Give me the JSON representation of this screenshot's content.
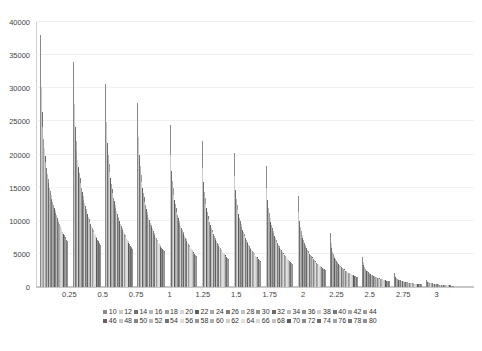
{
  "chart_data": {
    "type": "bar",
    "title": "",
    "subtitle": "",
    "xlabel": "",
    "ylabel": "",
    "xlim": [
      0,
      3.28
    ],
    "ylim": [
      0,
      40000
    ],
    "grid": true,
    "legend_position": "bottom",
    "y_ticks": [
      0,
      5000,
      10000,
      15000,
      20000,
      25000,
      30000,
      35000,
      40000
    ],
    "y_tick_labels": [
      "0",
      "5000",
      "10000",
      "15000",
      "20000",
      "25000",
      "30000",
      "35000",
      "40000"
    ],
    "x_ticks": [
      0.25,
      0.5,
      0.75,
      1,
      1.25,
      1.5,
      1.75,
      2,
      2.25,
      2.5,
      2.75,
      3
    ],
    "x_tick_labels": [
      "0.25",
      "0.5",
      "0.75",
      "1",
      "1.25",
      "1.5",
      "1.75",
      "2",
      "2.25",
      "2.5",
      "2.75",
      "3"
    ],
    "series_names": [
      "10",
      "12",
      "14",
      "16",
      "18",
      "20",
      "22",
      "24",
      "26",
      "28",
      "30",
      "32",
      "34",
      "36",
      "38",
      "40",
      "42",
      "44",
      "46",
      "48",
      "50",
      "52",
      "54",
      "56",
      "58",
      "60",
      "62",
      "64",
      "66",
      "68",
      "70",
      "72",
      "74",
      "76",
      "78",
      "80"
    ],
    "series_colors": [
      "#8a8a8a",
      "#c9c9c9",
      "#6f6f6f",
      "#b4b4b4",
      "#9e9e9e",
      "#d6d6d6",
      "#5f5f5f",
      "#a8a8a8",
      "#7d7d7d",
      "#c0c0c0",
      "#949494",
      "#6a6a6a",
      "#bdbdbd",
      "#8f8f8f",
      "#d0d0d0",
      "#777777",
      "#ababab",
      "#9a9a9a",
      "#636363",
      "#c5c5c5",
      "#858585",
      "#b8b8b8",
      "#737373",
      "#dcdcdc",
      "#989898",
      "#aeaeae",
      "#cfcfcf",
      "#e0e0e0",
      "#d9d9d9",
      "#c3c3c3",
      "#5a5a5a",
      "#8c8c8c",
      "#6c6c6c",
      "#a0a0a0",
      "#7a7a7a",
      "#909090"
    ],
    "categories": [
      0.1,
      0.2,
      0.3,
      0.4,
      0.5,
      0.6,
      0.7,
      0.8,
      0.9,
      1.0,
      1.1,
      1.2,
      1.3
    ],
    "clusters": [
      {
        "x_start": 0.03,
        "peak": 38000,
        "tail": 7200,
        "n": 36
      },
      {
        "x_start": 0.28,
        "peak": 34000,
        "tail": 7000,
        "n": 36
      },
      {
        "x_start": 0.52,
        "peak": 30600,
        "tail": 6500,
        "n": 36
      },
      {
        "x_start": 0.76,
        "peak": 27800,
        "tail": 6100,
        "n": 36
      },
      {
        "x_start": 1.0,
        "peak": 24500,
        "tail": 5500,
        "n": 36
      },
      {
        "x_start": 1.24,
        "peak": 22000,
        "tail": 4900,
        "n": 36
      },
      {
        "x_start": 1.48,
        "peak": 20300,
        "tail": 4200,
        "n": 36
      },
      {
        "x_start": 1.72,
        "peak": 18200,
        "tail": 3400,
        "n": 36
      },
      {
        "x_start": 1.96,
        "peak": 13800,
        "tail": 2600,
        "n": 36
      },
      {
        "x_start": 2.2,
        "peak": 8200,
        "tail": 1800,
        "n": 36
      },
      {
        "x_start": 2.44,
        "peak": 4600,
        "tail": 900,
        "n": 36
      },
      {
        "x_start": 2.68,
        "peak": 2100,
        "tail": 400,
        "n": 36
      },
      {
        "x_start": 2.92,
        "peak": 1100,
        "tail": 150,
        "n": 36
      }
    ],
    "series": [
      {
        "name": "10",
        "values": [
          38000,
          34000,
          30600,
          27800,
          24500,
          22000,
          20300,
          18200,
          13800,
          8200,
          4600,
          2100,
          1100
        ]
      },
      {
        "name": "12",
        "values": [
          30200,
          27600,
          24900,
          22700,
          20000,
          18000,
          16700,
          14900,
          11300,
          6700,
          3750,
          1720,
          900
        ]
      },
      {
        "name": "14",
        "values": [
          26400,
          24200,
          21800,
          19900,
          17500,
          15800,
          14600,
          13100,
          9900,
          5900,
          3300,
          1510,
          790
        ]
      },
      {
        "name": "16",
        "values": [
          24100,
          22100,
          19900,
          18200,
          16000,
          14400,
          13300,
          11900,
          9000,
          5350,
          3000,
          1370,
          715
        ]
      },
      {
        "name": "18",
        "values": [
          22400,
          20500,
          18500,
          16900,
          14900,
          13400,
          12400,
          11100,
          8400,
          4980,
          2790,
          1275,
          665
        ]
      },
      {
        "name": "20",
        "values": [
          21000,
          19200,
          17350,
          15850,
          13950,
          12550,
          11600,
          10400,
          7870,
          4670,
          2620,
          1195,
          625
        ]
      },
      {
        "name": "22",
        "values": [
          19850,
          18150,
          16400,
          14980,
          13200,
          11870,
          10970,
          9830,
          7440,
          4410,
          2470,
          1130,
          590
        ]
      },
      {
        "name": "24",
        "values": [
          18830,
          17220,
          15560,
          14210,
          12520,
          11260,
          10410,
          9320,
          7060,
          4185,
          2345,
          1072,
          560
        ]
      },
      {
        "name": "26",
        "values": [
          17920,
          16390,
          14810,
          13520,
          11910,
          10710,
          9900,
          8870,
          6715,
          3982,
          2231,
          1020,
          532
        ]
      },
      {
        "name": "28",
        "values": [
          17100,
          15640,
          14130,
          12900,
          11360,
          10220,
          9450,
          8460,
          6406,
          3799,
          2128,
          973,
          508
        ]
      },
      {
        "name": "30",
        "values": [
          16350,
          14950,
          13510,
          12335,
          10865,
          9770,
          9035,
          8090,
          6125,
          3632,
          2035,
          930,
          486
        ]
      },
      {
        "name": "32",
        "values": [
          15660,
          14320,
          12940,
          11815,
          10405,
          9356,
          8652,
          7747,
          5866,
          3478,
          1949,
          891,
          465
        ]
      },
      {
        "name": "34",
        "values": [
          15020,
          13740,
          12415,
          11335,
          9982,
          8976,
          8300,
          7432,
          5627,
          3337,
          1869,
          854,
          446
        ]
      },
      {
        "name": "36",
        "values": [
          14430,
          13200,
          11925,
          10890,
          9590,
          8623,
          7974,
          7140,
          5406,
          3206,
          1796,
          821,
          428
        ]
      },
      {
        "name": "38",
        "values": [
          13880,
          12695,
          11470,
          10473,
          9224,
          8294,
          7670,
          6867,
          5200,
          3084,
          1727,
          790,
          412
        ]
      },
      {
        "name": "40",
        "values": [
          13360,
          12220,
          11040,
          10080,
          8878,
          7982,
          7381,
          6609,
          5004,
          2968,
          1662,
          760,
          396
        ]
      },
      {
        "name": "42",
        "values": [
          12870,
          11772,
          10636,
          9712,
          8553,
          7690,
          7110,
          6367,
          4820,
          2859,
          1601,
          732,
          382
        ]
      },
      {
        "name": "44",
        "values": [
          12410,
          11350,
          10254,
          9363,
          8247,
          7414,
          6855,
          6139,
          4648,
          2757,
          1544,
          706,
          368
        ]
      },
      {
        "name": "46",
        "values": [
          11975,
          10952,
          9895,
          9035,
          7957,
          7154,
          6615,
          5923,
          4485,
          2660,
          1490,
          681,
          355
        ]
      },
      {
        "name": "48",
        "values": [
          11562,
          10574,
          9553,
          8723,
          7683,
          6908,
          6387,
          5719,
          4330,
          2568,
          1438,
          658,
          343
        ]
      },
      {
        "name": "50",
        "values": [
          11170,
          10215,
          9229,
          8427,
          7422,
          6672,
          6170,
          5525,
          4183,
          2481,
          1389,
          636,
          331
        ]
      },
      {
        "name": "52",
        "values": [
          10796,
          9873,
          8920,
          8145,
          7174,
          6450,
          5964,
          5340,
          4043,
          2398,
          1343,
          614,
          320
        ]
      },
      {
        "name": "54",
        "values": [
          10440,
          9547,
          8626,
          7877,
          6938,
          6238,
          5768,
          5165,
          3910,
          2319,
          1299,
          594,
          310
        ]
      },
      {
        "name": "56",
        "values": [
          10099,
          9235,
          8344,
          7620,
          6712,
          6034,
          5580,
          4997,
          3783,
          2243,
          1256,
          575,
          300
        ]
      },
      {
        "name": "58",
        "values": [
          9773,
          8937,
          8075,
          7374,
          6496,
          5840,
          5400,
          4835,
          3661,
          2171,
          1216,
          556,
          290
        ]
      },
      {
        "name": "60",
        "values": [
          9460,
          8650,
          7816,
          7138,
          6288,
          5654,
          5228,
          4681,
          3544,
          2101,
          1177,
          538,
          281
        ]
      },
      {
        "name": "62",
        "values": [
          9160,
          8376,
          7567,
          6911,
          6089,
          5475,
          5062,
          4533,
          3431,
          2035,
          1140,
          521,
          272
        ]
      },
      {
        "name": "64",
        "values": [
          8871,
          8111,
          7328,
          6692,
          5896,
          5302,
          4903,
          4390,
          3323,
          1971,
          1104,
          505,
          263
        ]
      },
      {
        "name": "66",
        "values": [
          8594,
          7857,
          7098,
          6482,
          5711,
          5135,
          4749,
          4253,
          3219,
          1909,
          1069,
          489,
          255
        ]
      },
      {
        "name": "68",
        "values": [
          8327,
          7612,
          6876,
          6279,
          5532,
          4974,
          4601,
          4120,
          3119,
          1850,
          1036,
          474,
          247
        ]
      },
      {
        "name": "70",
        "values": [
          8069,
          7376,
          6662,
          6083,
          5359,
          4819,
          4457,
          3991,
          3021,
          1792,
          1004,
          459,
          239
        ]
      },
      {
        "name": "72",
        "values": [
          7820,
          7148,
          6455,
          5893,
          5192,
          4669,
          4318,
          3867,
          2927,
          1736,
          972,
          445,
          232
        ]
      },
      {
        "name": "74",
        "values": [
          7580,
          6928,
          6255,
          5710,
          5030,
          4523,
          4184,
          3747,
          2836,
          1682,
          942,
          431,
          225
        ]
      },
      {
        "name": "76",
        "values": [
          7348,
          6715,
          6061,
          5533,
          4874,
          4383,
          4054,
          3631,
          2748,
          1630,
          913,
          418,
          218
        ]
      },
      {
        "name": "78",
        "values": [
          7123,
          6509,
          5874,
          5361,
          4723,
          4247,
          3928,
          3518,
          2662,
          1579,
          885,
          405,
          211
        ]
      },
      {
        "name": "80",
        "values": [
          6905,
          6309,
          5692,
          5195,
          4577,
          4115,
          3806,
          3409,
          2580,
          1530,
          857,
          392,
          205
        ]
      }
    ]
  },
  "legend": {
    "row1": [
      "10",
      "12",
      "14",
      "16",
      "18",
      "20",
      "22",
      "24",
      "26",
      "28",
      "30",
      "32",
      "34",
      "36",
      "38",
      "40",
      "42",
      "44"
    ],
    "row2": [
      "46",
      "48",
      "50",
      "52",
      "54",
      "56",
      "58",
      "60",
      "62",
      "64",
      "66",
      "68",
      "70",
      "72",
      "74",
      "76",
      "78",
      "80"
    ]
  }
}
